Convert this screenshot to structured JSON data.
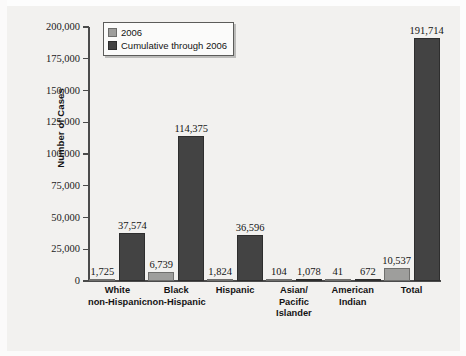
{
  "chart_data": {
    "type": "bar",
    "title": "",
    "xlabel": "",
    "ylabel": "Number of Cases",
    "ylim": [
      0,
      200000
    ],
    "ytick_labels": [
      "200,000",
      "175,000",
      "150,000",
      "125,000",
      "100,000",
      "75,000",
      "50,000",
      "25,000",
      "0"
    ],
    "ytick_values": [
      200000,
      175000,
      150000,
      125000,
      100000,
      75000,
      50000,
      25000,
      0
    ],
    "grid": false,
    "legend_position": "top-left",
    "categories": [
      "White\nnon-Hispanic",
      "Black\nnon-Hispanic",
      "Hispanic",
      "Asian/\nPacific\nIslander",
      "American\nIndian",
      "Total"
    ],
    "series": [
      {
        "name": "2006",
        "color": "#9e9e9c",
        "values": [
          1725,
          6739,
          1824,
          104,
          41,
          10537
        ],
        "labels": [
          "1,725",
          "6,739",
          "1,824",
          "104",
          "41",
          "10,537"
        ]
      },
      {
        "name": "Cumulative through 2006",
        "color": "#434343",
        "values": [
          37574,
          114375,
          36596,
          1078,
          672,
          191714
        ],
        "labels": [
          "37,574",
          "114,375",
          "36,596",
          "1,078",
          "672",
          "191,714"
        ]
      }
    ]
  },
  "legend": {
    "items": [
      {
        "label": "2006",
        "swatch": "light"
      },
      {
        "label": "Cumulative through 2006",
        "swatch": "dark"
      }
    ]
  },
  "colors": {
    "series_2006": "#9e9e9c",
    "series_cumulative": "#434343",
    "axis": "#4b4b4b",
    "text": "#131313",
    "background": "#f2f1ef"
  }
}
